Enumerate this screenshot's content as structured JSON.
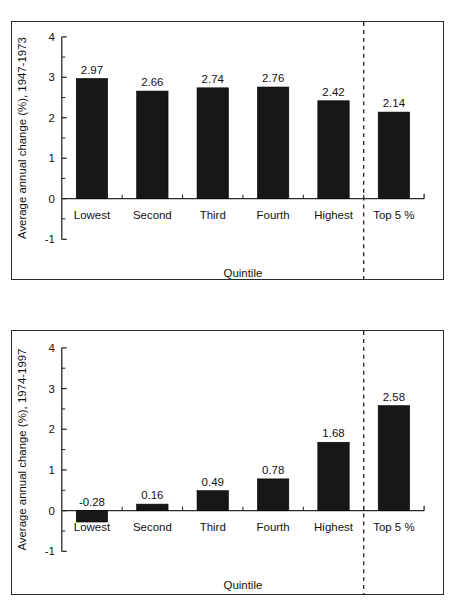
{
  "figure": {
    "panels": [
      "top",
      "bottom"
    ]
  },
  "chart_data": [
    {
      "id": "top",
      "type": "bar",
      "title": "",
      "xlabel": "Quintile",
      "ylabel": "Average annual change (%), 1947-1973",
      "categories": [
        "Lowest",
        "Second",
        "Third",
        "Fourth",
        "Highest",
        "Top 5 %"
      ],
      "values": [
        2.97,
        2.66,
        2.74,
        2.76,
        2.42,
        2.14
      ],
      "value_labels": [
        "2.97",
        "2.66",
        "2.74",
        "2.76",
        "2.42",
        "2.14"
      ],
      "ylim": [
        -1,
        4
      ],
      "ytick_labels": [
        "4",
        "3",
        "2",
        "1",
        "0",
        "-1"
      ],
      "yticks": [
        4,
        3,
        2,
        1,
        0,
        -1
      ],
      "yticks_minor": [
        3.5,
        2.5,
        1.5,
        0.5,
        -0.5
      ],
      "grid": false,
      "legend": "none",
      "divider_after_category": "Highest",
      "divider_style": "dashed-vertical"
    },
    {
      "id": "bottom",
      "type": "bar",
      "title": "",
      "xlabel": "Quintile",
      "ylabel": "Average annual change (%), 1974-1997",
      "categories": [
        "Lowest",
        "Second",
        "Third",
        "Fourth",
        "Highest",
        "Top 5 %"
      ],
      "values": [
        -0.28,
        0.16,
        0.49,
        0.78,
        1.68,
        2.58
      ],
      "value_labels": [
        "-0.28",
        "0.16",
        "0.49",
        "0.78",
        "1.68",
        "2.58"
      ],
      "ylim": [
        -1,
        4
      ],
      "ytick_labels": [
        "4",
        "3",
        "2",
        "1",
        "0",
        "-1"
      ],
      "yticks": [
        4,
        3,
        2,
        1,
        0,
        -1
      ],
      "yticks_minor": [
        3.5,
        2.5,
        1.5,
        0.5,
        -0.5
      ],
      "grid": false,
      "legend": "none",
      "divider_after_category": "Highest",
      "divider_style": "dashed-vertical"
    }
  ],
  "colors": {
    "bar_fill": "#171717",
    "axis": "#2b2b2b",
    "text": "#111111",
    "background": "#ffffff"
  }
}
